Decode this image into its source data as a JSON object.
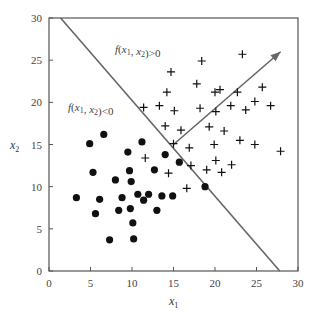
{
  "chart_data": {
    "type": "scatter",
    "title": "",
    "xlabel": "x1",
    "ylabel": "x2",
    "xlim": [
      0,
      30
    ],
    "ylim": [
      0,
      30
    ],
    "xticks": [
      0,
      5,
      10,
      15,
      20,
      25,
      30
    ],
    "yticks": [
      0,
      5,
      10,
      15,
      20,
      25,
      30
    ],
    "grid": false,
    "legend": null,
    "annotations": [
      {
        "text": "f(x1, x2)>0",
        "x": 8.0,
        "y": 26.0
      },
      {
        "text": "f(x1, x2)<0",
        "x": 2.3,
        "y": 19.5
      }
    ],
    "decision_boundary": {
      "x": [
        1.4,
        27.8
      ],
      "y": [
        30,
        0
      ]
    },
    "normal_arrow": {
      "from": [
        15.0,
        15.0
      ],
      "to": [
        27.9,
        26.0
      ]
    },
    "series": [
      {
        "name": "positive (+)",
        "marker": "plus",
        "points": [
          [
            18.4,
            24.9
          ],
          [
            23.3,
            25.7
          ],
          [
            14.7,
            23.6
          ],
          [
            17.8,
            22.2
          ],
          [
            14.2,
            21.2
          ],
          [
            20.0,
            21.2
          ],
          [
            20.6,
            21.5
          ],
          [
            25.7,
            21.8
          ],
          [
            22.7,
            21.2
          ],
          [
            11.4,
            19.4
          ],
          [
            13.3,
            19.6
          ],
          [
            15.1,
            19.0
          ],
          [
            18.2,
            19.3
          ],
          [
            20.1,
            18.9
          ],
          [
            21.9,
            19.6
          ],
          [
            23.7,
            19.1
          ],
          [
            24.8,
            20.1
          ],
          [
            26.7,
            19.6
          ],
          [
            14.0,
            17.2
          ],
          [
            15.9,
            16.7
          ],
          [
            19.3,
            17.1
          ],
          [
            21.1,
            16.6
          ],
          [
            15.0,
            15.1
          ],
          [
            16.9,
            14.6
          ],
          [
            19.9,
            15.0
          ],
          [
            23.0,
            15.5
          ],
          [
            24.8,
            15.0
          ],
          [
            27.9,
            14.2
          ],
          [
            11.6,
            13.4
          ],
          [
            20.1,
            13.1
          ],
          [
            17.1,
            12.5
          ],
          [
            22.0,
            12.6
          ],
          [
            19.0,
            12.0
          ],
          [
            20.8,
            11.7
          ],
          [
            14.4,
            11.6
          ],
          [
            16.6,
            9.8
          ]
        ]
      },
      {
        "name": "negative (•)",
        "marker": "dot",
        "points": [
          [
            6.6,
            16.2
          ],
          [
            4.9,
            15.1
          ],
          [
            11.2,
            15.3
          ],
          [
            9.5,
            14.1
          ],
          [
            14.0,
            13.8
          ],
          [
            15.7,
            12.9
          ],
          [
            5.3,
            11.7
          ],
          [
            9.7,
            11.9
          ],
          [
            12.7,
            12.0
          ],
          [
            9.9,
            10.6
          ],
          [
            8.0,
            10.8
          ],
          [
            3.3,
            8.7
          ],
          [
            6.1,
            8.5
          ],
          [
            8.8,
            8.7
          ],
          [
            10.7,
            9.1
          ],
          [
            11.4,
            8.4
          ],
          [
            12.0,
            9.1
          ],
          [
            13.6,
            8.9
          ],
          [
            14.9,
            8.9
          ],
          [
            13.0,
            7.2
          ],
          [
            5.6,
            6.8
          ],
          [
            8.4,
            7.2
          ],
          [
            9.8,
            7.4
          ],
          [
            10.1,
            5.7
          ],
          [
            7.3,
            3.7
          ],
          [
            10.2,
            3.8
          ],
          [
            18.8,
            10.0
          ]
        ]
      }
    ]
  },
  "labels": {
    "xlabel_main": "x",
    "xlabel_sub": "1",
    "ylabel_main": "x",
    "ylabel_sub": "2",
    "annot_pos": ">0",
    "annot_neg": "<0"
  },
  "colors": {
    "axis": "#555555",
    "line": "#666666",
    "marker": "#111111"
  }
}
